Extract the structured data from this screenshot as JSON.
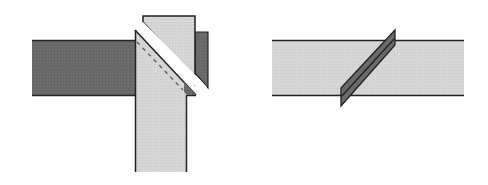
{
  "figure": {
    "title": "",
    "panels": [
      {
        "id": "left",
        "description": "Two strips joined at a right angle with a diagonal fold/seam; dashed stitch line along the diagonal",
        "elements": [
          "dark-horizontal-strip",
          "light-vertical-strip",
          "light-folded-flap",
          "dark-end-flap",
          "diagonal-gap",
          "dashed-stitch-line"
        ]
      },
      {
        "id": "right",
        "description": "Single light strip with a diagonal seam allowance shown as a dark slanted parallelogram",
        "elements": [
          "light-horizontal-strip",
          "diagonal-seam-allowance"
        ]
      }
    ]
  },
  "colors": {
    "dark_fabric": "#6b6b6b",
    "light_fabric": "#d4d4d4",
    "outline": "#222222",
    "background": "#ffffff",
    "seam_dark": "#6a6a6a"
  }
}
